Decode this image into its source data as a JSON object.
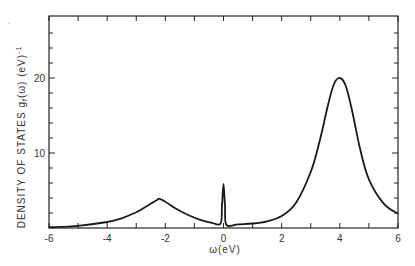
{
  "chart_data": {
    "type": "line",
    "title": "",
    "xlabel": "ω(eV)",
    "ylabel": "DENSITY OF STATES  g_f(ω) (eV)^-1",
    "xlim": [
      -6,
      6
    ],
    "ylim": [
      0,
      28
    ],
    "x_ticks": [
      -6,
      -4,
      -2,
      0,
      2,
      4,
      6
    ],
    "y_ticks_labeled": [
      10,
      20
    ],
    "y_minor_step": 2,
    "x_minor_step": 1,
    "grid": false,
    "legend": null,
    "series": [
      {
        "name": "g_f(ω)",
        "x": [
          -6,
          -5,
          -4,
          -3.5,
          -3,
          -2.6,
          -2.3,
          -2.2,
          -2.0,
          -1.6,
          -1.2,
          -0.8,
          -0.4,
          -0.1,
          -0.05,
          0.0,
          0.05,
          0.1,
          0.5,
          1.0,
          1.5,
          2.0,
          2.5,
          3.0,
          3.3,
          3.6,
          3.8,
          4.0,
          4.2,
          4.4,
          4.7,
          5.0,
          5.5,
          6.0
        ],
        "values": [
          0.1,
          0.3,
          0.8,
          1.3,
          2.1,
          3.0,
          3.7,
          3.9,
          3.5,
          2.5,
          1.7,
          1.1,
          0.7,
          0.6,
          3.0,
          5.9,
          3.0,
          0.4,
          0.5,
          0.6,
          0.9,
          1.6,
          3.4,
          7.5,
          11.5,
          16.5,
          19.2,
          20.0,
          19.0,
          16.0,
          10.5,
          6.5,
          3.3,
          1.9
        ]
      }
    ],
    "annotations": [
      {
        "label": "narrow peak near Fermi level",
        "x": 0.0,
        "y": 5.9
      },
      {
        "label": "lower Hubbard peak",
        "x": -2.2,
        "y": 3.9
      },
      {
        "label": "upper peak",
        "x": 4.0,
        "y": 20.0
      }
    ]
  },
  "labels": {
    "xlabel": "ω(eV)",
    "ylabel_main": "DENSITY  OF  STATES  g",
    "ylabel_sub": "f",
    "ylabel_tail": "(ω)  (eV)",
    "ylabel_sup": "-1",
    "x_tick_labels": [
      "-6",
      "-4",
      "-2",
      "0",
      "2",
      "4",
      "6"
    ],
    "y_tick_labels": [
      "10",
      "20"
    ]
  }
}
